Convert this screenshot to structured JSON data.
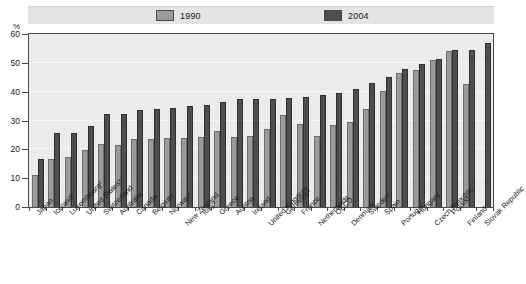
{
  "chart_data": {
    "type": "bar",
    "title": "",
    "subtitle": "",
    "xlabel": "",
    "ylabel": "%",
    "unit": "%",
    "ylim": [
      0,
      60
    ],
    "yticks": [
      0,
      10,
      20,
      30,
      40,
      50,
      60
    ],
    "ytick_labels": [
      "0",
      "10",
      "20",
      "30",
      "40",
      "50",
      "60"
    ],
    "grid": true,
    "legend_position": "top",
    "sorted_by": "2004 ascending",
    "categories": [
      "Japan",
      "Iceland¹",
      "Luxembourg²",
      "United States³",
      "Switzerland",
      "Australia",
      "Canada",
      "Belgium",
      "Norway¹",
      "New Zealand",
      "Italy³",
      "Greece",
      "Austria",
      "Ireland",
      "United Kingdom",
      "Germany¹",
      "France",
      "Netherlands",
      "OECD",
      "Denmark",
      "Sweden",
      "Spain",
      "Portugal",
      "Hungary",
      "Czech Republic",
      "Poland",
      "Finland",
      "Slovak Republic"
    ],
    "series": [
      {
        "name": "1990",
        "color": "#9a9a9a",
        "values": [
          11.2,
          16.7,
          17.4,
          19.8,
          21.9,
          21.4,
          23.6,
          23.7,
          23.9,
          24.1,
          24.3,
          26.5,
          24.4,
          24.5,
          27.0,
          31.8,
          28.8,
          24.5,
          28.6,
          29.5,
          33.9,
          40.2,
          46.4,
          47.6,
          51.0,
          54.0,
          42.8,
          null
        ]
      },
      {
        "name": "2004",
        "color": "#4e4e4e",
        "values": [
          16.5,
          25.5,
          25.8,
          28.2,
          32.1,
          32.4,
          33.5,
          34.0,
          34.4,
          35.0,
          35.3,
          36.5,
          37.3,
          37.4,
          37.6,
          37.7,
          38.0,
          38.7,
          39.5,
          41.0,
          42.9,
          45.0,
          47.7,
          49.7,
          51.5,
          54.5,
          54.4,
          57.0
        ]
      }
    ]
  },
  "legend": {
    "items": [
      {
        "label": "1990",
        "color": "#9a9a9a"
      },
      {
        "label": "2004",
        "color": "#4e4e4e"
      }
    ]
  },
  "axis": {
    "unit": "%"
  }
}
